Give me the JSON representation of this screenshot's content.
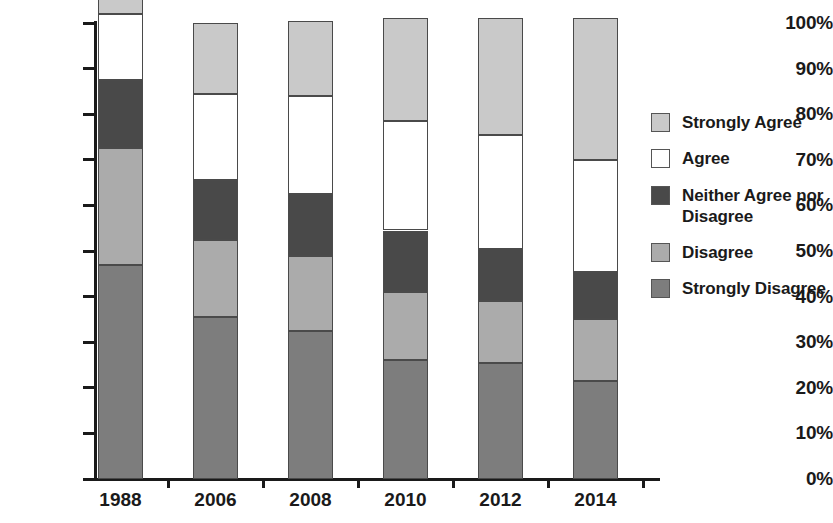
{
  "chart_data": {
    "type": "bar",
    "subtype": "stacked-percentage-column",
    "title": "",
    "subtitle": "",
    "xlabel": "",
    "ylabel": "",
    "categories": [
      "1988",
      "2006",
      "2008",
      "2010",
      "2012",
      "2014"
    ],
    "ylim": [
      0,
      100
    ],
    "ytick_labels": [
      "0%",
      "10%",
      "20%",
      "30%",
      "40%",
      "50%",
      "60%",
      "70%",
      "80%",
      "90%",
      "100%"
    ],
    "ytick_values": [
      0,
      10,
      20,
      30,
      40,
      50,
      60,
      70,
      80,
      90,
      100
    ],
    "grid": false,
    "legend_position": "right",
    "stack_order_bottom_to_top": [
      "Strongly Disagree",
      "Disagree",
      "Neither Agree nor Disagree",
      "Agree",
      "Strongly Agree"
    ],
    "series": [
      {
        "name": "Strongly Agree",
        "color": "#c9c9c9",
        "values": [
          3.5,
          15.5,
          16.5,
          22.5,
          25.5,
          31.0
        ]
      },
      {
        "name": "Agree",
        "color": "#ffffff",
        "values": [
          14.5,
          19.0,
          21.5,
          24.0,
          25.0,
          24.5
        ]
      },
      {
        "name": "Neither Agree nor Disagree",
        "color": "#494949",
        "values": [
          15.0,
          13.0,
          13.5,
          13.5,
          11.5,
          10.5
        ]
      },
      {
        "name": "Disagree",
        "color": "#ababab",
        "values": [
          25.5,
          17.0,
          16.5,
          15.0,
          13.5,
          13.5
        ]
      },
      {
        "name": "Strongly Disagree",
        "color": "#7d7d7d",
        "values": [
          47.0,
          35.5,
          32.5,
          26.0,
          25.5,
          21.5
        ]
      }
    ],
    "cumulative_tops": {
      "1988": {
        "Strongly Disagree": 47.0,
        "Disagree": 72.5,
        "Neither Agree nor Disagree": 87.5,
        "Agree": 97.0,
        "Strongly Agree": 100.5
      },
      "2006": {
        "Strongly Disagree": 35.5,
        "Disagree": 52.5,
        "Neither Agree nor Disagree": 65.5,
        "Agree": 84.5,
        "Strongly Agree": 100.5
      },
      "2008": {
        "Strongly Disagree": 32.5,
        "Disagree": 49.0,
        "Neither Agree nor Disagree": 62.5,
        "Agree": 84.0,
        "Strongly Agree": 100.5
      },
      "2010": {
        "Strongly Disagree": 26.0,
        "Disagree": 41.0,
        "Neither Agree nor Disagree": 54.5,
        "Agree": 78.5,
        "Strongly Agree": 101.0
      },
      "2012": {
        "Strongly Disagree": 25.5,
        "Disagree": 39.0,
        "Neither Agree nor Disagree": 50.5,
        "Agree": 75.5,
        "Strongly Agree": 101.0
      },
      "2014": {
        "Strongly Disagree": 21.5,
        "Disagree": 35.0,
        "Neither Agree nor Disagree": 45.5,
        "Agree": 70.0,
        "Strongly Agree": 101.0
      }
    }
  },
  "legend": {
    "items": [
      {
        "label": "Strongly Agree",
        "color": "#c9c9c9"
      },
      {
        "label": "Agree",
        "color": "#ffffff"
      },
      {
        "label": "Neither Agree nor Disagree",
        "color": "#494949"
      },
      {
        "label": "Disagree",
        "color": "#ababab"
      },
      {
        "label": "Strongly Disagree",
        "color": "#7d7d7d"
      }
    ]
  },
  "axis": {
    "y_labels": [
      "100%",
      "90%",
      "80%",
      "70%",
      "60%",
      "50%",
      "40%",
      "30%",
      "20%",
      "10%",
      "0%"
    ],
    "x_labels": [
      "1988",
      "2006",
      "2008",
      "2010",
      "2012",
      "2014"
    ]
  }
}
